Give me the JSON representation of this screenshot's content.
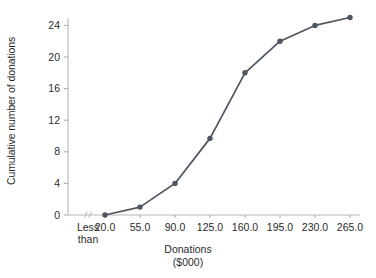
{
  "chart_data": {
    "type": "line",
    "title": "",
    "subtitle": "",
    "xlabel": "Donations",
    "xlabel_line2": "($000)",
    "ylabel": "Cumulative number of donations",
    "x": [
      20.0,
      55.0,
      90.0,
      125.0,
      160.0,
      195.0,
      230.0,
      265.0
    ],
    "x_tick_labels": [
      "20.0",
      "55.0",
      "90.0",
      "125.0",
      "160.0",
      "195.0",
      "230.0",
      "265.0"
    ],
    "x_origin_label": "Less\nthan",
    "values": [
      0,
      1,
      4,
      9.7,
      18,
      22,
      24,
      25
    ],
    "series": [
      {
        "name": "Cumulative number of donations",
        "values": [
          0,
          1,
          4,
          9.7,
          18,
          22,
          24,
          25
        ]
      }
    ],
    "y_tick_labels": [
      "0",
      "4",
      "8",
      "12",
      "16",
      "20",
      "24"
    ],
    "y_ticks": [
      0,
      4,
      8,
      12,
      16,
      20,
      24
    ],
    "ylim": [
      0,
      26
    ],
    "xlim": [
      20.0,
      280.0
    ],
    "grid": false,
    "legend": false,
    "legend_position": "none",
    "axis_break": true,
    "axis_break_note": "break symbol on x-axis between origin and first tick",
    "marker": "filled-circle",
    "colors": {
      "series_line": "#4e555f",
      "marker": "#4e555f",
      "axis": "#b8b8b8",
      "tick": "#b0b0b0",
      "text": "#2b2b2b",
      "background": "#ffffff"
    }
  }
}
